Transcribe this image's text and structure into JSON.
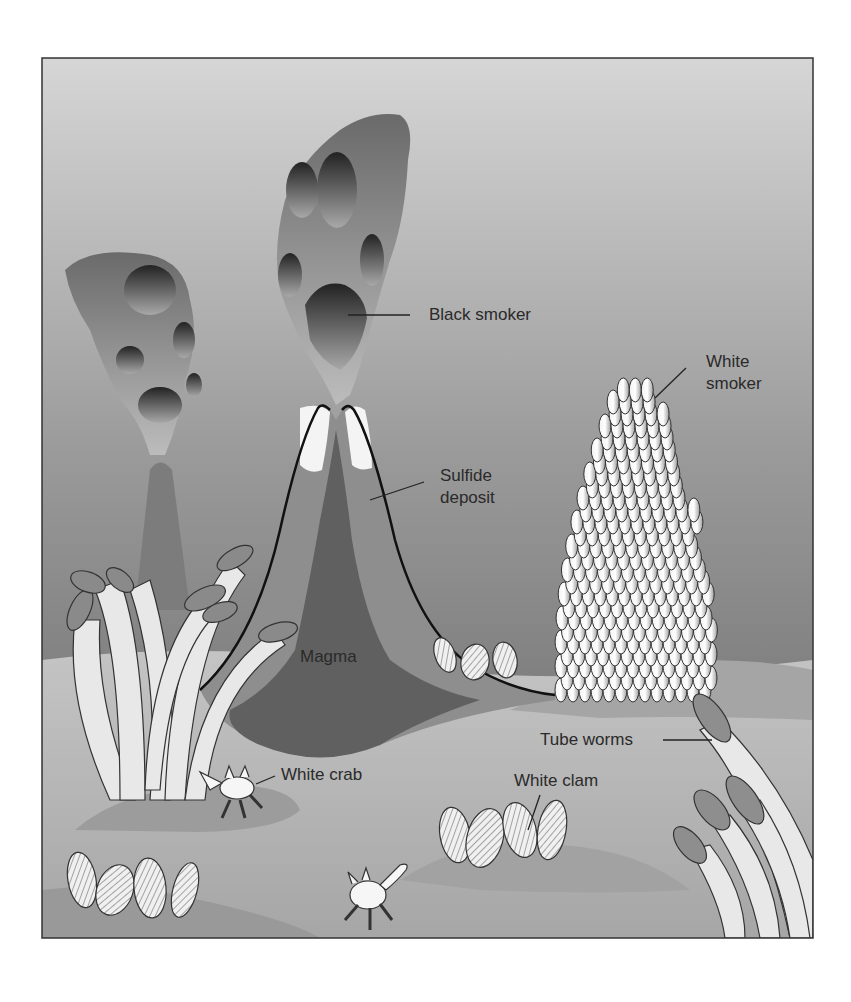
{
  "figure": {
    "colors": {
      "water_top": "#d2d2d2",
      "water_bottom": "#6c6c6c",
      "seafloor": "#bdbdbd",
      "seafloor_dark": "#8a8a8a",
      "magma": "#5e5e5e",
      "sulfide": "#8f8f8f",
      "tube_white": "#e8e8e8",
      "plume_tip": "#8a8a8a"
    }
  },
  "labels": {
    "black_smoker": "Black smoker",
    "white_smoker_line1": "White",
    "white_smoker_line2": "smoker",
    "sulfide_line1": "Sulfide",
    "sulfide_line2": "deposit",
    "magma": "Magma",
    "tube_worms": "Tube worms",
    "white_crab": "White crab",
    "white_clam": "White clam"
  }
}
